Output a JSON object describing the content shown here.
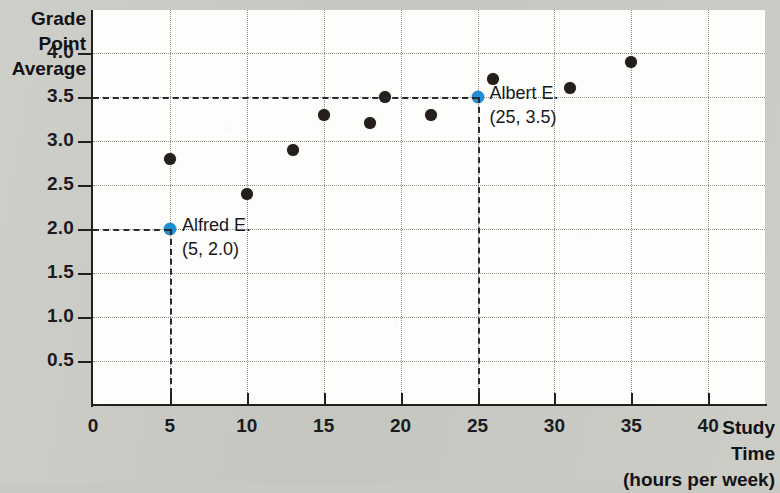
{
  "chart_data": {
    "type": "scatter",
    "title": "",
    "xlabel": "Study Time (hours per week)",
    "ylabel": "Grade Point Average",
    "xlabel_lines": [
      "Study",
      "Time",
      "(hours per week)"
    ],
    "ylabel_lines": [
      "Grade",
      "Point",
      "Average"
    ],
    "xlim": [
      0,
      43.8
    ],
    "ylim": [
      0,
      4.5
    ],
    "xticks": [
      0,
      5,
      10,
      15,
      20,
      25,
      30,
      35,
      40
    ],
    "xtick_labels": [
      "0",
      "5",
      "10",
      "15",
      "20",
      "25",
      "30",
      "35",
      "40"
    ],
    "yticks": [
      0.5,
      1.0,
      1.5,
      2.0,
      2.5,
      3.0,
      3.5,
      4.0
    ],
    "ytick_labels": [
      "0.5",
      "1.0",
      "1.5",
      "2.0",
      "2.5",
      "3.0",
      "3.5",
      "4.0"
    ],
    "grid": true,
    "grid_style": "dotted",
    "legend": "none",
    "points": [
      {
        "x": 5,
        "y": 2.0,
        "highlight": true
      },
      {
        "x": 5,
        "y": 2.8,
        "highlight": false
      },
      {
        "x": 10,
        "y": 2.4,
        "highlight": false
      },
      {
        "x": 13,
        "y": 2.9,
        "highlight": false
      },
      {
        "x": 15,
        "y": 3.3,
        "highlight": false
      },
      {
        "x": 18,
        "y": 3.2,
        "highlight": false
      },
      {
        "x": 19,
        "y": 3.5,
        "highlight": false
      },
      {
        "x": 22,
        "y": 3.3,
        "highlight": false
      },
      {
        "x": 25,
        "y": 3.5,
        "highlight": true
      },
      {
        "x": 26,
        "y": 3.7,
        "highlight": false
      },
      {
        "x": 31,
        "y": 3.6,
        "highlight": false
      },
      {
        "x": 35,
        "y": 3.9,
        "highlight": false
      }
    ],
    "annotations": [
      {
        "name": "Alfred E.",
        "coords": "(5, 2.0)",
        "x": 5,
        "y": 2.0
      },
      {
        "name": "Albert E.",
        "coords": "(25, 3.5)",
        "x": 25,
        "y": 3.5
      }
    ],
    "colors": {
      "highlight_point": "#1a8ed6",
      "point": "#241f1d",
      "axis": "#231f20",
      "grid": "#8d8d8a",
      "plot_background": "#fdfdfb",
      "page_background": "#c9c9c4"
    }
  }
}
